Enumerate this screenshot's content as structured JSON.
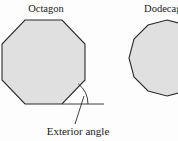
{
  "figure": {
    "type": "geometry-diagram",
    "background_color": "#fdfdfd",
    "shapes": [
      {
        "name": "octagon",
        "label": "Octagon",
        "sides": 8,
        "fill_color": "#e0e0e0",
        "stroke_color": "#2b2b2b",
        "label_x": 46,
        "label_y": 12,
        "points": "25,20 62,20 85,44 85,80 62,104 25,104 2,80 2,44"
      },
      {
        "name": "dodecagon",
        "label": "Dodecagon",
        "sides": 12,
        "fill_color": "#e0e0e0",
        "stroke_color": "#2b2b2b",
        "label_x": 168,
        "label_y": 12,
        "points": "167,20 186,25 200,39 205,58 200,77 186,91 167,96 148,91 134,77 129,58 134,39 148,25"
      }
    ],
    "annotations": [
      {
        "name": "exterior-angle",
        "text": "Exterior angle",
        "text_x": 78,
        "text_y": 135,
        "extension_line": {
          "x1": 62,
          "y1": 104,
          "x2": 104,
          "y2": 104
        },
        "arc_path": "M 88 104 A 26 26 0 0 0 78.1 83.7",
        "leader_line": {
          "x1": 84,
          "y1": 96,
          "x2": 75,
          "y2": 124
        },
        "stroke_color": "#2b2b2b"
      }
    ]
  }
}
